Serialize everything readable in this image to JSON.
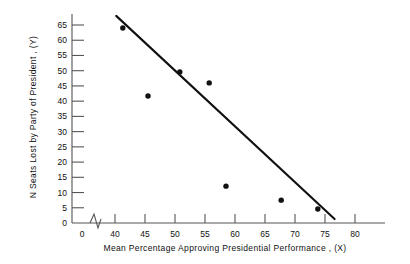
{
  "chart_data": {
    "type": "scatter",
    "title": "",
    "xlabel": "Mean Percentage Approving Presidential Performance , (X)",
    "ylabel": "N Seats Lost by Party of President , (Y)",
    "xlim": [
      36,
      82
    ],
    "ylim": [
      0,
      68
    ],
    "grid": false,
    "legend": "none",
    "axis_break_x": true,
    "x_ticks": [
      0,
      40,
      45,
      50,
      55,
      60,
      65,
      70,
      75,
      80
    ],
    "y_ticks": [
      0,
      5,
      10,
      15,
      20,
      25,
      30,
      35,
      40,
      45,
      50,
      55,
      60,
      65
    ],
    "points": [
      {
        "x": 41.3,
        "y": 64.0
      },
      {
        "x": 45.5,
        "y": 41.7
      },
      {
        "x": 50.8,
        "y": 49.6
      },
      {
        "x": 55.7,
        "y": 46.0
      },
      {
        "x": 58.5,
        "y": 12.1
      },
      {
        "x": 67.7,
        "y": 7.5
      },
      {
        "x": 73.8,
        "y": 4.6
      }
    ],
    "trendline": {
      "name": "least-squares regression line",
      "x_start": 40.2,
      "y_start": 68.0,
      "x_end": 76.6,
      "y_end": 1.3
    },
    "colors": {
      "point": "#111111",
      "line": "#111111",
      "axis": "#555555"
    }
  },
  "axis": {
    "x_title": "Mean  Percentage  Approving  Presidential  Performance , (X)",
    "y_title": "N Seats Lost by Party of President , (Y)"
  }
}
